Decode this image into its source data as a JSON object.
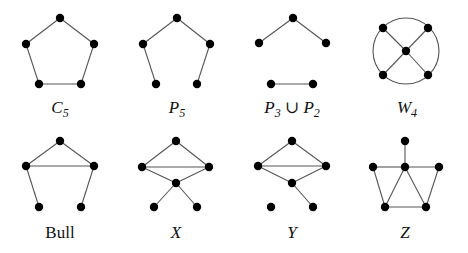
{
  "figure": {
    "colors": {
      "edge": "#555555",
      "node": "#000000",
      "text": "#111111",
      "background": "#ffffff"
    },
    "graphs": [
      {
        "id": "c5",
        "label_main": "C",
        "label_sub": "5",
        "italic": true,
        "label_pos": [
          60,
          113
        ],
        "nodes": [
          [
            60,
            18
          ],
          [
            94,
            44
          ],
          [
            81,
            84
          ],
          [
            39,
            84
          ],
          [
            26,
            44
          ]
        ],
        "edges": [
          [
            0,
            1
          ],
          [
            1,
            2
          ],
          [
            2,
            3
          ],
          [
            3,
            4
          ],
          [
            4,
            0
          ]
        ]
      },
      {
        "id": "p5",
        "label_main": "P",
        "label_sub": "5",
        "italic": true,
        "label_pos": [
          177,
          113
        ],
        "nodes": [
          [
            177,
            18
          ],
          [
            210,
            44
          ],
          [
            197,
            84
          ],
          [
            156,
            84
          ],
          [
            143,
            44
          ]
        ],
        "edges": [
          [
            0,
            1
          ],
          [
            1,
            2
          ],
          [
            3,
            4
          ],
          [
            4,
            0
          ]
        ]
      },
      {
        "id": "p3-union-p2",
        "label_main": "P",
        "label_sub": "3",
        "label_mid": " ∪ ",
        "label_main2": "P",
        "label_sub2": "2",
        "italic": true,
        "label_pos": [
          292,
          113
        ],
        "nodes": [
          [
            293,
            18
          ],
          [
            326,
            43
          ],
          [
            259,
            43
          ],
          [
            271,
            84
          ],
          [
            313,
            84
          ]
        ],
        "edges": [
          [
            0,
            1
          ],
          [
            0,
            2
          ],
          [
            3,
            4
          ]
        ]
      },
      {
        "id": "w4",
        "label_main": "W",
        "label_sub": "4",
        "italic": true,
        "label_pos": [
          407,
          113
        ],
        "circle": {
          "cx": 406,
          "cy": 51,
          "r": 33
        },
        "nodes": [
          [
            406,
            51
          ],
          [
            383,
            28
          ],
          [
            428,
            28
          ],
          [
            383,
            75
          ],
          [
            428,
            75
          ]
        ],
        "edges": [
          [
            0,
            1
          ],
          [
            0,
            2
          ],
          [
            0,
            3
          ],
          [
            0,
            4
          ]
        ]
      },
      {
        "id": "bull",
        "label_main": "Bull",
        "label_sub": "",
        "italic": false,
        "label_pos": [
          60,
          238
        ],
        "nodes": [
          [
            60,
            141
          ],
          [
            94,
            166
          ],
          [
            26,
            166
          ],
          [
            39,
            207
          ],
          [
            81,
            207
          ]
        ],
        "edges": [
          [
            0,
            1
          ],
          [
            0,
            2
          ],
          [
            1,
            2
          ],
          [
            2,
            3
          ],
          [
            1,
            4
          ]
        ]
      },
      {
        "id": "x",
        "label_main": "X",
        "label_sub": "",
        "italic": true,
        "label_pos": [
          176,
          238
        ],
        "nodes": [
          [
            176,
            141
          ],
          [
            209,
            167
          ],
          [
            142,
            167
          ],
          [
            176,
            183
          ],
          [
            154,
            207
          ],
          [
            197,
            207
          ]
        ],
        "edges": [
          [
            0,
            1
          ],
          [
            0,
            2
          ],
          [
            1,
            2
          ],
          [
            2,
            3
          ],
          [
            1,
            3
          ],
          [
            3,
            4
          ],
          [
            3,
            5
          ]
        ]
      },
      {
        "id": "y",
        "label_main": "Y",
        "label_sub": "",
        "italic": true,
        "label_pos": [
          292,
          238
        ],
        "nodes": [
          [
            292,
            141
          ],
          [
            326,
            166
          ],
          [
            258,
            166
          ],
          [
            292,
            183
          ],
          [
            271,
            207
          ],
          [
            313,
            207
          ]
        ],
        "edges": [
          [
            0,
            1
          ],
          [
            0,
            2
          ],
          [
            1,
            2
          ],
          [
            2,
            3
          ],
          [
            1,
            3
          ],
          [
            3,
            5
          ]
        ]
      },
      {
        "id": "z",
        "label_main": "Z",
        "label_sub": "",
        "italic": true,
        "label_pos": [
          405,
          238
        ],
        "nodes": [
          [
            405,
            141
          ],
          [
            373,
            167
          ],
          [
            405,
            167
          ],
          [
            439,
            167
          ],
          [
            385,
            207
          ],
          [
            426,
            207
          ]
        ],
        "edges": [
          [
            0,
            2
          ],
          [
            1,
            2
          ],
          [
            2,
            3
          ],
          [
            1,
            4
          ],
          [
            2,
            4
          ],
          [
            2,
            5
          ],
          [
            3,
            5
          ],
          [
            4,
            5
          ]
        ]
      }
    ]
  }
}
